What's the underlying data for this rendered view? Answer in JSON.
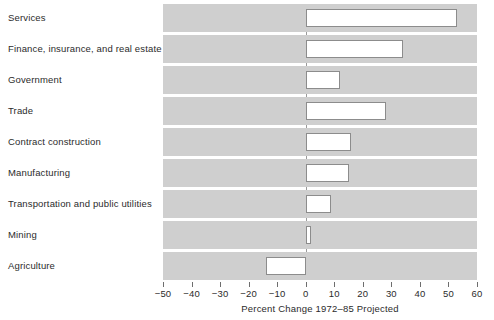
{
  "chart_data": {
    "type": "bar",
    "orientation": "horizontal",
    "title": "",
    "xlabel": "Percent Change 1972–85 Projected",
    "ylabel": "",
    "xlim": [
      -50,
      60
    ],
    "xticks": [
      -50,
      -40,
      -30,
      -20,
      -10,
      0,
      10,
      20,
      30,
      40,
      50,
      60
    ],
    "xticklabels": [
      "−50",
      "−40",
      "−30",
      "−20",
      "−10",
      "0",
      "10",
      "20",
      "30",
      "40",
      "50",
      "60"
    ],
    "grid": false,
    "legend": null,
    "categories": [
      "Services",
      "Finance, insurance, and real estate",
      "Government",
      "Trade",
      "Contract construction",
      "Manufacturing",
      "Transportation and public utilities",
      "Mining",
      "Agriculture"
    ],
    "values": [
      53,
      34,
      12,
      28,
      16,
      15,
      9,
      2,
      -14
    ],
    "bar_facecolor": "#ffffff",
    "bar_edgecolor": "#8c8c8c",
    "band_color": "#cfcfcf",
    "background": "#ffffff"
  }
}
